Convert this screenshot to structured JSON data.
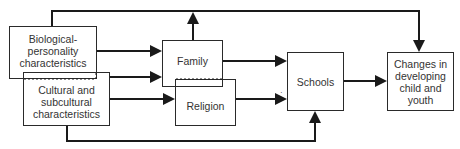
{
  "diagram": {
    "nodes": {
      "biological": {
        "label": "Biological-\npersonality\ncharacteristics"
      },
      "cultural": {
        "label": "Cultural and\nsubcultural\ncharacteristics"
      },
      "family": {
        "label": "Family"
      },
      "religion": {
        "label": "Religion"
      },
      "schools": {
        "label": "Schools"
      },
      "changes": {
        "label": "Changes in\ndeveloping\nchild and\nyouth"
      }
    },
    "edges": [
      {
        "from": "biological",
        "to": "family"
      },
      {
        "from": "biological",
        "to": "changes"
      },
      {
        "from": "cultural",
        "to": "family"
      },
      {
        "from": "cultural",
        "to": "religion"
      },
      {
        "from": "cultural",
        "to": "schools"
      },
      {
        "from": "family",
        "to": "schools"
      },
      {
        "from": "religion",
        "to": "schools"
      },
      {
        "from": "schools",
        "to": "changes"
      }
    ],
    "colors": {
      "line": "#1a1a1a",
      "text": "#333333"
    }
  }
}
